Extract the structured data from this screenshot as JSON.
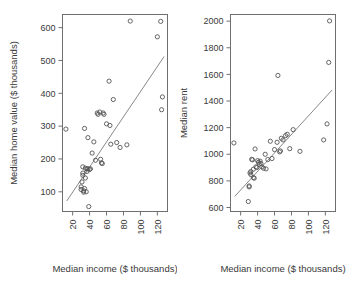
{
  "figure": {
    "background": "#ffffff",
    "point_color": "#555555",
    "line_color": "#7a7a7a",
    "axis_color": "#6f6f6f"
  },
  "chart_data": [
    {
      "type": "scatter",
      "title": "",
      "xlabel": "Median income ($ thousands)",
      "ylabel": "Median home value ($ thousands)",
      "xlim": [
        8,
        132
      ],
      "ylim": [
        40,
        640
      ],
      "xticks": [
        20,
        40,
        60,
        80,
        100,
        120
      ],
      "xticklabels": [
        "20",
        "40",
        "60",
        "80",
        "100",
        "120"
      ],
      "xtick_rotation": 90,
      "yticks": [
        100,
        200,
        300,
        400,
        500,
        600
      ],
      "yticklabels": [
        "100",
        "200",
        "300",
        "400",
        "500",
        "600"
      ],
      "grid": false,
      "legend": "none",
      "fit_line": {
        "x": [
          13,
          128
        ],
        "y": [
          72,
          512
        ]
      },
      "points": [
        {
          "x": 12,
          "y": 291
        },
        {
          "x": 30,
          "y": 115
        },
        {
          "x": 30,
          "y": 107
        },
        {
          "x": 31,
          "y": 130
        },
        {
          "x": 32,
          "y": 176
        },
        {
          "x": 32,
          "y": 157
        },
        {
          "x": 32,
          "y": 150
        },
        {
          "x": 33,
          "y": 103
        },
        {
          "x": 33,
          "y": 99
        },
        {
          "x": 34,
          "y": 110
        },
        {
          "x": 34,
          "y": 293
        },
        {
          "x": 35,
          "y": 172
        },
        {
          "x": 35,
          "y": 142
        },
        {
          "x": 36,
          "y": 100
        },
        {
          "x": 37,
          "y": 170
        },
        {
          "x": 37,
          "y": 162
        },
        {
          "x": 38,
          "y": 265
        },
        {
          "x": 38,
          "y": 170
        },
        {
          "x": 39,
          "y": 55
        },
        {
          "x": 40,
          "y": 168
        },
        {
          "x": 41,
          "y": 170
        },
        {
          "x": 43,
          "y": 218
        },
        {
          "x": 45,
          "y": 252
        },
        {
          "x": 47,
          "y": 196
        },
        {
          "x": 49,
          "y": 340
        },
        {
          "x": 50,
          "y": 336
        },
        {
          "x": 52,
          "y": 343
        },
        {
          "x": 53,
          "y": 199
        },
        {
          "x": 54,
          "y": 188
        },
        {
          "x": 55,
          "y": 186
        },
        {
          "x": 56,
          "y": 340
        },
        {
          "x": 57,
          "y": 336
        },
        {
          "x": 60,
          "y": 307
        },
        {
          "x": 63,
          "y": 437
        },
        {
          "x": 64,
          "y": 302
        },
        {
          "x": 65,
          "y": 245
        },
        {
          "x": 68,
          "y": 381
        },
        {
          "x": 72,
          "y": 250
        },
        {
          "x": 76,
          "y": 235
        },
        {
          "x": 84,
          "y": 243
        },
        {
          "x": 88,
          "y": 620
        },
        {
          "x": 120,
          "y": 572
        },
        {
          "x": 124,
          "y": 619
        },
        {
          "x": 126,
          "y": 389
        },
        {
          "x": 125,
          "y": 350
        }
      ]
    },
    {
      "type": "scatter",
      "title": "",
      "xlabel": "Median income ($ thousands)",
      "ylabel": "Median rent",
      "xlim": [
        8,
        132
      ],
      "ylim": [
        570,
        2050
      ],
      "xticks": [
        20,
        40,
        60,
        80,
        100,
        120
      ],
      "xticklabels": [
        "20",
        "40",
        "60",
        "80",
        "100",
        "120"
      ],
      "xtick_rotation": 90,
      "yticks": [
        600,
        800,
        1000,
        1200,
        1400,
        1600,
        1800,
        2000
      ],
      "yticklabels": [
        "600",
        "800",
        "1000",
        "1200",
        "1400",
        "1600",
        "1800",
        "2000"
      ],
      "grid": false,
      "legend": "none",
      "fit_line": {
        "x": [
          13,
          128
        ],
        "y": [
          683,
          1483
        ]
      },
      "points": [
        {
          "x": 12,
          "y": 1085
        },
        {
          "x": 29,
          "y": 645
        },
        {
          "x": 30,
          "y": 762
        },
        {
          "x": 30,
          "y": 755
        },
        {
          "x": 31,
          "y": 860
        },
        {
          "x": 32,
          "y": 848
        },
        {
          "x": 32,
          "y": 870
        },
        {
          "x": 33,
          "y": 962
        },
        {
          "x": 34,
          "y": 958
        },
        {
          "x": 35,
          "y": 888
        },
        {
          "x": 35,
          "y": 825
        },
        {
          "x": 36,
          "y": 820
        },
        {
          "x": 37,
          "y": 1040
        },
        {
          "x": 38,
          "y": 905
        },
        {
          "x": 39,
          "y": 900
        },
        {
          "x": 40,
          "y": 952
        },
        {
          "x": 41,
          "y": 940
        },
        {
          "x": 42,
          "y": 925
        },
        {
          "x": 43,
          "y": 948
        },
        {
          "x": 44,
          "y": 930
        },
        {
          "x": 45,
          "y": 905
        },
        {
          "x": 47,
          "y": 895
        },
        {
          "x": 49,
          "y": 1000
        },
        {
          "x": 50,
          "y": 890
        },
        {
          "x": 52,
          "y": 960
        },
        {
          "x": 55,
          "y": 1098
        },
        {
          "x": 57,
          "y": 968
        },
        {
          "x": 60,
          "y": 1035
        },
        {
          "x": 63,
          "y": 1090
        },
        {
          "x": 64,
          "y": 1592
        },
        {
          "x": 66,
          "y": 1018
        },
        {
          "x": 67,
          "y": 1025
        },
        {
          "x": 68,
          "y": 1120
        },
        {
          "x": 70,
          "y": 1108
        },
        {
          "x": 73,
          "y": 1140
        },
        {
          "x": 75,
          "y": 1150
        },
        {
          "x": 78,
          "y": 1042
        },
        {
          "x": 82,
          "y": 1185
        },
        {
          "x": 90,
          "y": 1022
        },
        {
          "x": 118,
          "y": 1108
        },
        {
          "x": 122,
          "y": 1228
        },
        {
          "x": 124,
          "y": 1690
        },
        {
          "x": 125,
          "y": 2002
        }
      ]
    }
  ]
}
